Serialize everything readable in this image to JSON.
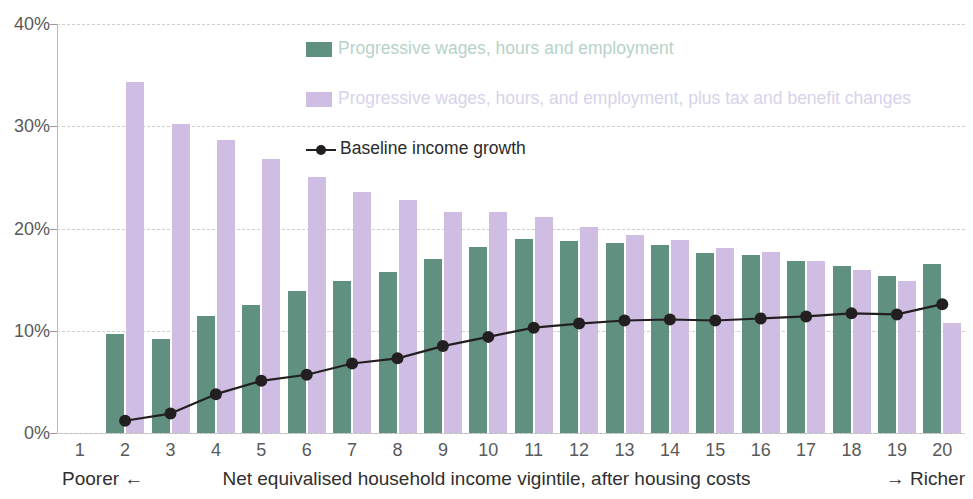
{
  "chart_data": {
    "type": "bar",
    "title": "",
    "xlabel": "Net equivalised household income vigintile, after housing costs",
    "ylabel": "",
    "ylim": [
      0,
      40
    ],
    "yticks": [
      "0%",
      "10%",
      "20%",
      "30%",
      "40%"
    ],
    "ytick_values": [
      0,
      10,
      20,
      30,
      40
    ],
    "grid": true,
    "legend_position": "inside-top-center",
    "categories": [
      "1",
      "2",
      "3",
      "4",
      "5",
      "6",
      "7",
      "8",
      "9",
      "10",
      "11",
      "12",
      "13",
      "14",
      "15",
      "16",
      "17",
      "18",
      "19",
      "20"
    ],
    "series": [
      {
        "name": "Progressive wages, hours and employment",
        "type": "bar",
        "color": "#5f9080",
        "label_color": "#b6d2c9",
        "values": [
          null,
          9.7,
          9.2,
          11.4,
          12.5,
          13.9,
          14.9,
          15.7,
          17.0,
          18.2,
          19.0,
          18.8,
          18.6,
          18.4,
          17.6,
          17.4,
          16.8,
          16.3,
          15.4,
          16.5
        ]
      },
      {
        "name": "Progressive wages, hours, and employment, plus tax and benefit changes",
        "type": "bar",
        "color": "#cfbde4",
        "label_color": "#d8d2ea",
        "values": [
          null,
          34.3,
          30.2,
          28.7,
          26.8,
          25.0,
          23.6,
          22.8,
          21.6,
          21.6,
          21.1,
          20.1,
          19.4,
          18.9,
          18.1,
          17.7,
          16.8,
          15.9,
          14.9,
          10.8
        ]
      },
      {
        "name": "Baseline income growth",
        "type": "line",
        "color": "#231f20",
        "label_color": "#2b2b2b",
        "values": [
          null,
          1.2,
          1.9,
          3.8,
          5.1,
          5.7,
          6.8,
          7.3,
          8.5,
          9.4,
          10.3,
          10.7,
          11.0,
          11.1,
          11.0,
          11.2,
          11.4,
          11.7,
          11.6,
          12.6
        ]
      }
    ],
    "axis_captions": {
      "left": "Poorer ←",
      "center": "Net equivalised household income vigintile, after housing costs",
      "right": "→ Richer"
    }
  },
  "colors": {
    "green": "#5f9080",
    "purple": "#cfbde4",
    "line": "#231f20",
    "grid": "#cfcfcf",
    "axis": "#b9b9b9",
    "tick_text": "#59595b",
    "background": "#ffffff"
  }
}
